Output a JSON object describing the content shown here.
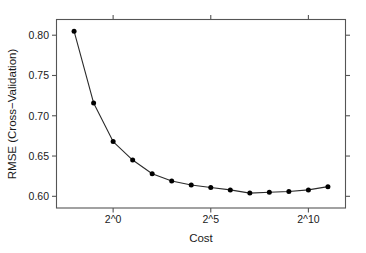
{
  "chart_data": {
    "type": "line",
    "title": "",
    "subtitle": "",
    "xlabel": "Cost",
    "ylabel": "RMSE (Cross−Validation)",
    "x_tick_labels": [
      "2^0",
      "2^5",
      "2^10"
    ],
    "x_tick_values": [
      0,
      5,
      10
    ],
    "y_tick_labels": [
      "0.60",
      "0.65",
      "0.70",
      "0.75",
      "0.80"
    ],
    "y_tick_values": [
      0.6,
      0.65,
      0.7,
      0.75,
      0.8
    ],
    "xlim": [
      -2.9,
      11.9
    ],
    "ylim": [
      0.5855,
      0.8195
    ],
    "x_scale": "log2 exponent",
    "grid": false,
    "legend": false,
    "markers": "filled-circle",
    "series": [
      {
        "name": "RMSE (Cross-Validation)",
        "x": [
          -2,
          -1,
          0,
          1,
          2,
          3,
          4,
          5,
          6,
          7,
          8,
          9,
          10,
          11
        ],
        "x_labels": [
          "2^-2",
          "2^-1",
          "2^0",
          "2^1",
          "2^2",
          "2^3",
          "2^4",
          "2^5",
          "2^6",
          "2^7",
          "2^8",
          "2^9",
          "2^10",
          "2^11"
        ],
        "values": [
          0.805,
          0.716,
          0.668,
          0.645,
          0.628,
          0.619,
          0.614,
          0.611,
          0.608,
          0.604,
          0.605,
          0.606,
          0.608,
          0.612
        ],
        "color": "#000000"
      }
    ],
    "colors": {
      "line": "#2b2b2b",
      "point": "#000000",
      "axis": "#555555",
      "text": "#1a1a1a",
      "background": "#ffffff"
    }
  }
}
